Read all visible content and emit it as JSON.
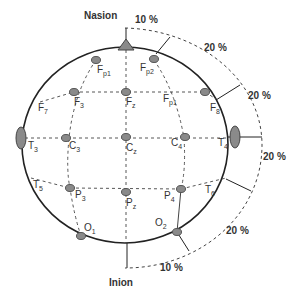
{
  "diagram": {
    "landmarks": {
      "nasion": "Nasion",
      "inion": "Inion"
    },
    "percentages": {
      "top": "10 %",
      "upper_right": "20 %",
      "right_upper": "20 %",
      "right_mid": "20 %",
      "lower_right": "20 %",
      "bottom": "10 %"
    },
    "electrodes": [
      {
        "id": "Fp1",
        "main": "F",
        "sub": "p1"
      },
      {
        "id": "Fp2",
        "main": "F",
        "sub": "p2"
      },
      {
        "id": "F7",
        "main": "F",
        "sub": "7"
      },
      {
        "id": "F3",
        "main": "F",
        "sub": "3"
      },
      {
        "id": "Fz",
        "main": "F",
        "sub": "z"
      },
      {
        "id": "F4",
        "main": "F",
        "sub": "p1"
      },
      {
        "id": "F8",
        "main": "F",
        "sub": "8"
      },
      {
        "id": "T3",
        "main": "T",
        "sub": "3"
      },
      {
        "id": "C3",
        "main": "C",
        "sub": "3"
      },
      {
        "id": "Cz",
        "main": "C",
        "sub": "z"
      },
      {
        "id": "C4",
        "main": "C",
        "sub": "4"
      },
      {
        "id": "T4",
        "main": "T",
        "sub": "4"
      },
      {
        "id": "T5",
        "main": "T",
        "sub": "5"
      },
      {
        "id": "P3",
        "main": "P",
        "sub": "3"
      },
      {
        "id": "Pz",
        "main": "P",
        "sub": "z"
      },
      {
        "id": "P4",
        "main": "P",
        "sub": "4"
      },
      {
        "id": "T6",
        "main": "T",
        "sub": "6"
      },
      {
        "id": "O1",
        "main": "O",
        "sub": "1"
      },
      {
        "id": "O2",
        "main": "O",
        "sub": "2"
      }
    ],
    "colors": {
      "electrode_fill": "#8a8a8a",
      "electrode_stroke": "#555555",
      "head_stroke": "#222222",
      "dashed": "#444444",
      "text": "#333333"
    }
  }
}
